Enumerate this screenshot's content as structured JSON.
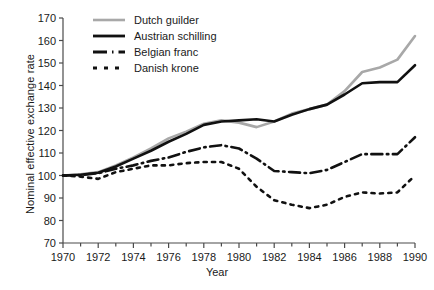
{
  "chart_data": {
    "type": "line",
    "title": "",
    "xlabel": "Year",
    "ylabel": "Nominal effective exchange rate",
    "xlim": [
      1970,
      1990
    ],
    "ylim": [
      70,
      170
    ],
    "ytick_step": 10,
    "yticks": [
      70,
      80,
      90,
      100,
      110,
      120,
      130,
      140,
      150,
      160,
      170
    ],
    "xticks": [
      1970,
      1971,
      1972,
      1973,
      1974,
      1975,
      1976,
      1977,
      1978,
      1979,
      1980,
      1981,
      1982,
      1983,
      1984,
      1985,
      1986,
      1987,
      1988,
      1989,
      1990
    ],
    "xtick_labels": [
      1970,
      1972,
      1974,
      1976,
      1978,
      1980,
      1982,
      1984,
      1986,
      1988,
      1990
    ],
    "grid": false,
    "legend_position": "top-left",
    "x": [
      1970,
      1971,
      1972,
      1973,
      1974,
      1975,
      1976,
      1977,
      1978,
      1979,
      1980,
      1981,
      1982,
      1983,
      1984,
      1985,
      1986,
      1987,
      1988,
      1989,
      1990
    ],
    "series": [
      {
        "name": "Dutch guilder",
        "color": "#a8a8a8",
        "style": "solid",
        "width": 2.6,
        "values": [
          100,
          100.5,
          101.5,
          104.5,
          108,
          112,
          116.5,
          119.5,
          123,
          124.5,
          123.5,
          121.5,
          124,
          127.5,
          129.5,
          131.5,
          137.5,
          146,
          148,
          151.5,
          162
        ]
      },
      {
        "name": "Austrian schilling",
        "color": "#111111",
        "style": "solid",
        "width": 2.6,
        "values": [
          100,
          100.3,
          101.2,
          104,
          107.5,
          111,
          115,
          118.5,
          122.5,
          124,
          124.5,
          125,
          124,
          127,
          129.5,
          131.5,
          136,
          141,
          141.5,
          141.5,
          149
        ]
      },
      {
        "name": "Belgian franc",
        "color": "#111111",
        "style": "dashed",
        "width": 2.6,
        "values": [
          100,
          100.2,
          101,
          103,
          104.5,
          106.5,
          108,
          110.5,
          112.5,
          113.5,
          112,
          107.5,
          102,
          101.5,
          101,
          102.5,
          106,
          109.5,
          109.5,
          109.5,
          117
        ]
      },
      {
        "name": "Danish krone",
        "color": "#111111",
        "style": "dotted",
        "width": 2.6,
        "values": [
          100,
          99.5,
          98.5,
          101.5,
          103,
          104.5,
          104.5,
          105.5,
          106,
          106,
          103,
          95,
          89,
          87,
          85.5,
          87,
          90.5,
          92.5,
          92,
          92.5,
          100
        ]
      }
    ]
  }
}
